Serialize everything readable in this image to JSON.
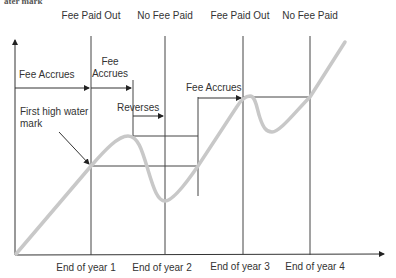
{
  "header_fragment": "ater mark",
  "top_labels": [
    "Fee Paid Out",
    "No Fee Paid",
    "Fee Paid Out",
    "No Fee Paid"
  ],
  "x_labels": [
    "End of year 1",
    "End of year 2",
    "End of year 3",
    "End of year 4"
  ],
  "annotations": {
    "fee_accrues_1": "Fee Accrues",
    "fee_accrues_2_line1": "Fee",
    "fee_accrues_2_line2": "Accrues",
    "reverses": "Reverses",
    "fee_accrues_3": "Fee Accrues",
    "first_hwm_line1": "First high water",
    "first_hwm_line2": "mark"
  },
  "colors": {
    "curve": "#c8c8c8",
    "lines": "#333333"
  }
}
